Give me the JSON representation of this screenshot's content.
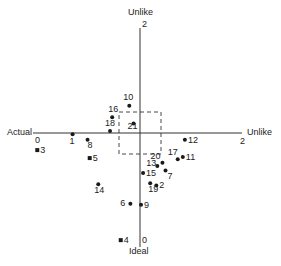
{
  "axes": {
    "top_label": "Unlike",
    "top_value": "2",
    "left_label": "Actual",
    "left_value": "0",
    "right_label": "Unlike",
    "right_value": "2",
    "bottom_label": "Ideal",
    "bottom_value": "0"
  },
  "colors": {
    "ink": "#1a1a1a",
    "axis": "#333333"
  },
  "chart_data": {
    "type": "scatter",
    "title": "",
    "xlabel": "Actual (0) — Unlike (2)",
    "ylabel": "Ideal (0) — Unlike (2)",
    "xlim": [
      0,
      2
    ],
    "ylim": [
      0,
      2
    ],
    "reference_box": {
      "x": [
        0.86,
        1.14
      ],
      "y": [
        0.82,
        1.1
      ]
    },
    "points": [
      {
        "id": "1",
        "x": 0.37,
        "y": 0.99,
        "marker": "circle"
      },
      {
        "id": "2",
        "x": 1.16,
        "y": 0.54,
        "marker": "circle"
      },
      {
        "id": "3",
        "x": 0.04,
        "y": 0.85,
        "marker": "square"
      },
      {
        "id": "4",
        "x": 0.82,
        "y": 0.06,
        "marker": "square"
      },
      {
        "id": "5",
        "x": 0.53,
        "y": 0.78,
        "marker": "square"
      },
      {
        "id": "6",
        "x": 0.91,
        "y": 0.38,
        "marker": "circle"
      },
      {
        "id": "7",
        "x": 1.25,
        "y": 0.67,
        "marker": "circle"
      },
      {
        "id": "8",
        "x": 0.51,
        "y": 0.94,
        "marker": "circle"
      },
      {
        "id": "9",
        "x": 1.01,
        "y": 0.37,
        "marker": "circle"
      },
      {
        "id": "10",
        "x": 0.9,
        "y": 1.26,
        "marker": "circle"
      },
      {
        "id": "11",
        "x": 1.42,
        "y": 0.79,
        "marker": "circle"
      },
      {
        "id": "12",
        "x": 1.44,
        "y": 0.94,
        "marker": "circle"
      },
      {
        "id": "13",
        "x": 1.17,
        "y": 0.71,
        "marker": "circle"
      },
      {
        "id": "14",
        "x": 0.61,
        "y": 0.55,
        "marker": "circle"
      },
      {
        "id": "15",
        "x": 1.03,
        "y": 0.65,
        "marker": "circle"
      },
      {
        "id": "16",
        "x": 0.74,
        "y": 1.15,
        "marker": "circle"
      },
      {
        "id": "17",
        "x": 1.37,
        "y": 0.77,
        "marker": "circle"
      },
      {
        "id": "18",
        "x": 0.72,
        "y": 1.02,
        "marker": "circle"
      },
      {
        "id": "19",
        "x": 1.1,
        "y": 0.56,
        "marker": "circle"
      },
      {
        "id": "20",
        "x": 1.22,
        "y": 0.74,
        "marker": "circle"
      },
      {
        "id": "21",
        "x": 0.94,
        "y": 1.09,
        "marker": "circle"
      }
    ]
  }
}
